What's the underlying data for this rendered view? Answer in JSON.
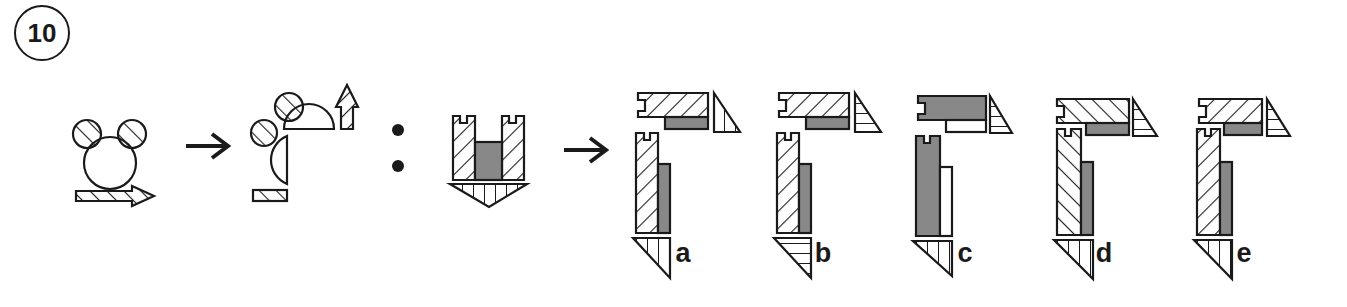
{
  "question": {
    "number": "10"
  },
  "problem": {
    "description": "Analogy puzzle: figure A transforms to figure B; figure C transforms to which option?",
    "separator": "colon",
    "arrow_icon": "right-arrow"
  },
  "options": [
    {
      "label": "a"
    },
    {
      "label": "b"
    },
    {
      "label": "c"
    },
    {
      "label": "d"
    },
    {
      "label": "e"
    }
  ],
  "colors": {
    "stroke": "#1a1a1a",
    "fill_gray": "#888888",
    "background": "#ffffff"
  }
}
